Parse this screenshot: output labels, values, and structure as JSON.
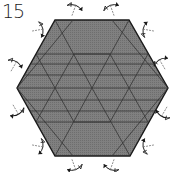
{
  "step": {
    "number": "15"
  },
  "diagram": {
    "shape": "hexagon",
    "fill_color": "#7a7a7a",
    "edge_color": "#1a1a1a",
    "crease_color": "#333333",
    "arrow_color": "#1a1a1a",
    "hexagon_points": "55,20 129,20 168,88 130,156 55,156 17,88",
    "crease_lines": [
      [
        36,
        54,
        148,
        54
      ],
      [
        30,
        64,
        155,
        64
      ],
      [
        24,
        75,
        161,
        75
      ],
      [
        17,
        88,
        168,
        88
      ],
      [
        24,
        100,
        161,
        100
      ],
      [
        30,
        111,
        155,
        111
      ],
      [
        36,
        122,
        148,
        122
      ],
      [
        55,
        20,
        92,
        88
      ],
      [
        129,
        20,
        92,
        88
      ],
      [
        55,
        156,
        92,
        88
      ],
      [
        130,
        156,
        92,
        88
      ],
      [
        17,
        88,
        73,
        20
      ],
      [
        168,
        88,
        112,
        20
      ],
      [
        17,
        88,
        73,
        156
      ],
      [
        168,
        88,
        112,
        156
      ],
      [
        36,
        54,
        74,
        122
      ],
      [
        148,
        54,
        110,
        122
      ],
      [
        36,
        122,
        74,
        54
      ],
      [
        148,
        122,
        110,
        54
      ],
      [
        74,
        54,
        110,
        54
      ],
      [
        74,
        122,
        110,
        122
      ]
    ],
    "arrows": [
      {
        "name": "arrow-top-left",
        "x": 74,
        "y": 10,
        "rot": 20
      },
      {
        "name": "arrow-top-right",
        "x": 112,
        "y": 10,
        "rot": -20
      },
      {
        "name": "arrow-upper-left",
        "x": 38,
        "y": 30,
        "rot": 80
      },
      {
        "name": "arrow-upper-right",
        "x": 148,
        "y": 30,
        "rot": -80
      },
      {
        "name": "arrow-left-upper",
        "x": 14,
        "y": 66,
        "rot": 30
      },
      {
        "name": "arrow-right-upper",
        "x": 162,
        "y": 64,
        "rot": -30
      },
      {
        "name": "arrow-left-lower",
        "x": 16,
        "y": 110,
        "rot": 150
      },
      {
        "name": "arrow-right-lower",
        "x": 164,
        "y": 112,
        "rot": -150
      },
      {
        "name": "arrow-lower-left",
        "x": 38,
        "y": 146,
        "rot": 100
      },
      {
        "name": "arrow-lower-right",
        "x": 148,
        "y": 146,
        "rot": -100
      },
      {
        "name": "arrow-bottom-left",
        "x": 74,
        "y": 165,
        "rot": 160
      },
      {
        "name": "arrow-bottom-right",
        "x": 112,
        "y": 165,
        "rot": -160
      }
    ]
  }
}
